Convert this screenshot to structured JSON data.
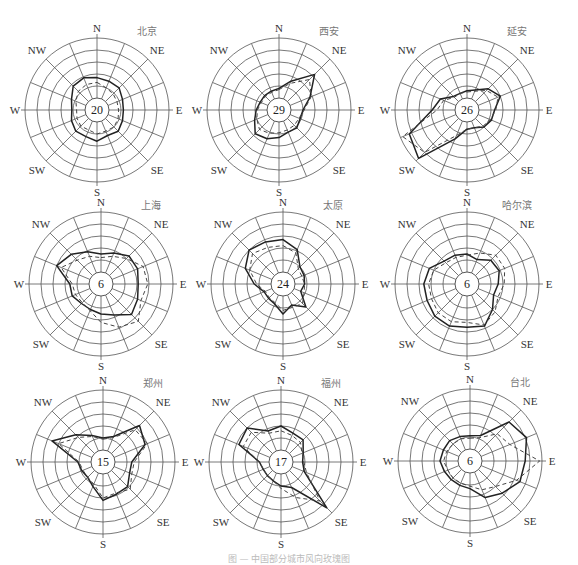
{
  "chart_data": {
    "type": "radar",
    "title": "",
    "directions": [
      "N",
      "NNE",
      "NE",
      "ENE",
      "E",
      "ESE",
      "SE",
      "SSE",
      "S",
      "SSW",
      "SW",
      "WSW",
      "W",
      "WNW",
      "NW",
      "NNW"
    ],
    "axis_labels": {
      "N": "N",
      "NE": "NE",
      "E": "E",
      "SE": "SE",
      "S": "S",
      "SW": "SW",
      "W": "W",
      "NW": "NW"
    },
    "rings": 5,
    "value_unit": "ring index (0 = calm circle edge, 5 = outer ring), estimated",
    "legend": [
      "solid line",
      "dashed line"
    ],
    "charts": [
      {
        "city": "北京",
        "calm": "20",
        "cx": 97,
        "cy": 110,
        "series": [
          {
            "name": "solid",
            "style": "solid",
            "values": [
              1.7,
              1.6,
              1.6,
              1.3,
              1.2,
              1.3,
              1.5,
              1.3,
              1.6,
              1.4,
              1.5,
              1.3,
              1.1,
              1.3,
              1.8,
              1.9
            ]
          },
          {
            "name": "dashed",
            "style": "dashed",
            "values": [
              1.3,
              1.0,
              0.9,
              0.8,
              0.8,
              0.9,
              1.0,
              0.9,
              1.0,
              0.8,
              0.9,
              0.8,
              0.7,
              0.9,
              1.2,
              1.3
            ]
          }
        ]
      },
      {
        "city": "西安",
        "calm": "29",
        "cx": 279,
        "cy": 110,
        "series": [
          {
            "name": "solid",
            "style": "solid",
            "values": [
              0.8,
              1.6,
              3.2,
              1.8,
              1.0,
              0.9,
              1.1,
              1.0,
              1.3,
              1.6,
              1.8,
              1.2,
              0.9,
              0.7,
              0.7,
              0.7
            ]
          },
          {
            "name": "dashed",
            "style": "dashed",
            "values": [
              0.7,
              1.4,
              2.6,
              1.9,
              1.1,
              0.8,
              0.8,
              0.8,
              0.9,
              1.1,
              1.3,
              1.0,
              0.8,
              0.6,
              0.6,
              0.6
            ]
          }
        ]
      },
      {
        "city": "延安",
        "calm": "26",
        "cx": 467,
        "cy": 110,
        "series": [
          {
            "name": "solid",
            "style": "solid",
            "values": [
              0.6,
              0.8,
              1.5,
              2.0,
              1.3,
              1.2,
              1.0,
              0.6,
              0.6,
              1.6,
              4.7,
              4.2,
              1.9,
              1.4,
              0.6,
              0.5
            ]
          },
          {
            "name": "dashed",
            "style": "dashed",
            "values": [
              0.5,
              0.7,
              1.3,
              1.8,
              1.4,
              1.1,
              0.9,
              0.6,
              0.6,
              1.3,
              4.0,
              4.8,
              1.5,
              1.1,
              0.5,
              0.5
            ]
          }
        ]
      },
      {
        "city": "上海",
        "calm": "6",
        "cx": 101,
        "cy": 284,
        "series": [
          {
            "name": "solid",
            "style": "solid",
            "values": [
              1.5,
              1.8,
              2.3,
              2.3,
              2.1,
              2.3,
              2.6,
              1.8,
              1.5,
              1.3,
              1.3,
              1.6,
              1.6,
              3.0,
              2.5,
              1.9
            ]
          },
          {
            "name": "dashed",
            "style": "dashed",
            "values": [
              1.2,
              1.5,
              2.0,
              2.8,
              2.9,
              2.6,
              3.4,
              2.9,
              2.2,
              1.4,
              1.2,
              1.3,
              1.4,
              2.6,
              1.8,
              1.5
            ]
          }
        ]
      },
      {
        "city": "太原",
        "calm": "24",
        "cx": 283,
        "cy": 284,
        "series": [
          {
            "name": "solid",
            "style": "solid",
            "values": [
              2.7,
              2.1,
              1.0,
              0.9,
              0.8,
              0.6,
              1.7,
              0.9,
              1.5,
              0.8,
              0.7,
              0.7,
              1.4,
              2.4,
              3.0,
              2.8
            ]
          },
          {
            "name": "dashed",
            "style": "dashed",
            "values": [
              2.2,
              1.8,
              0.8,
              0.7,
              0.8,
              0.9,
              1.3,
              1.1,
              1.2,
              0.7,
              0.6,
              0.6,
              1.2,
              2.0,
              2.6,
              2.3
            ]
          }
        ]
      },
      {
        "city": "哈尔滨",
        "calm": "6",
        "cx": 467,
        "cy": 284,
        "series": [
          {
            "name": "solid",
            "style": "solid",
            "values": [
              1.5,
              1.2,
              1.8,
              1.9,
              1.6,
              1.4,
              2.0,
              2.8,
              2.6,
              2.8,
              2.8,
              2.6,
              2.6,
              2.4,
              1.7,
              1.6
            ]
          },
          {
            "name": "dashed",
            "style": "dashed",
            "values": [
              1.4,
              1.8,
              2.4,
              2.4,
              2.1,
              1.8,
              2.3,
              2.7,
              2.2,
              2.4,
              2.4,
              2.2,
              2.2,
              2.0,
              1.5,
              1.4
            ]
          }
        ]
      },
      {
        "city": "郑州",
        "calm": "15",
        "cx": 103,
        "cy": 462,
        "series": [
          {
            "name": "solid",
            "style": "solid",
            "values": [
              1.0,
              1.3,
              3.3,
              2.8,
              1.4,
              1.4,
              1.9,
              1.9,
              2.2,
              1.2,
              0.8,
              0.9,
              1.1,
              3.6,
              2.2,
              1.4
            ]
          },
          {
            "name": "dashed",
            "style": "dashed",
            "values": [
              0.9,
              1.2,
              2.8,
              3.0,
              1.6,
              1.6,
              2.2,
              1.8,
              2.0,
              1.0,
              0.8,
              0.8,
              1.0,
              3.0,
              1.9,
              1.3
            ]
          }
        ]
      },
      {
        "city": "福州",
        "calm": "17",
        "cx": 281,
        "cy": 462,
        "series": [
          {
            "name": "solid",
            "style": "solid",
            "values": [
              2.0,
              1.6,
              1.6,
              1.0,
              0.8,
              1.1,
              4.4,
              1.3,
              1.0,
              0.7,
              0.6,
              0.6,
              0.8,
              2.8,
              3.0,
              1.8
            ]
          },
          {
            "name": "dashed",
            "style": "dashed",
            "values": [
              1.6,
              1.4,
              1.3,
              0.9,
              0.9,
              1.3,
              3.6,
              2.2,
              1.2,
              0.7,
              0.6,
              0.6,
              0.8,
              2.4,
              2.5,
              1.6
            ]
          }
        ]
      },
      {
        "city": "台北",
        "calm": "6",
        "cx": 470,
        "cy": 461,
        "series": [
          {
            "name": "solid",
            "style": "solid",
            "values": [
              1.1,
              1.3,
              3.6,
              4.1,
              3.6,
              3.5,
              2.8,
              2.3,
              1.3,
              1.2,
              1.2,
              1.3,
              1.5,
              1.4,
              1.4,
              1.2
            ]
          },
          {
            "name": "dashed",
            "style": "dashed",
            "values": [
              0.9,
              1.1,
              2.2,
              2.6,
              4.8,
              3.2,
              2.0,
              1.6,
              1.1,
              1.0,
              1.0,
              1.0,
              1.2,
              1.1,
              1.0,
              1.0
            ]
          }
        ]
      }
    ]
  },
  "figure": {
    "caption": "图 — 中国部分城市风向玫瑰图"
  }
}
